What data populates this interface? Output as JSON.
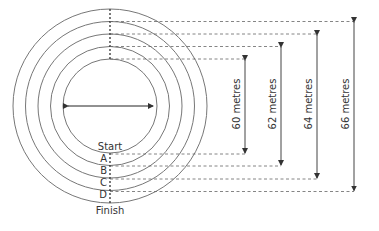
{
  "diagram": {
    "type": "running-track-concentric-circles",
    "center": {
      "x": 110,
      "y": 106
    },
    "circle_radii_px": [
      47,
      59,
      72,
      84,
      97
    ],
    "inner_arrow": {
      "label": ""
    },
    "track_labels": {
      "start": "Start",
      "lanes": [
        "A",
        "B",
        "C",
        "D"
      ],
      "finish": "Finish"
    },
    "measurements": [
      {
        "label": "60 metres",
        "value": 60,
        "unit": "metres",
        "x": 245,
        "top": 59,
        "bottom": 154
      },
      {
        "label": "62 metres",
        "value": 62,
        "unit": "metres",
        "x": 281,
        "top": 46,
        "bottom": 166
      },
      {
        "label": "64 metres",
        "value": 64,
        "unit": "metres",
        "x": 317,
        "top": 34,
        "bottom": 179
      },
      {
        "label": "66 metres",
        "value": 66,
        "unit": "metres",
        "x": 354,
        "top": 22,
        "bottom": 192
      }
    ],
    "colors": {
      "line": "#555555",
      "text": "#333333",
      "background": "#ffffff"
    }
  }
}
